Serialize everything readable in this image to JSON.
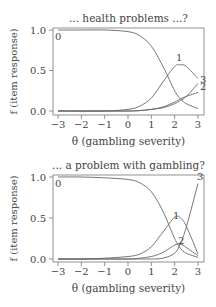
{
  "chart_data": [
    {
      "type": "line",
      "title": "... health problems ...?",
      "xlabel": "θ (gambling severity)",
      "ylabel": "f (item response)",
      "xlim": [
        -3,
        3
      ],
      "ylim": [
        0,
        1
      ],
      "xticks": [
        "-3",
        "-2",
        "-1",
        "0",
        "1",
        "2",
        "3"
      ],
      "yticks": [
        "0.0",
        "0.5",
        "1.0"
      ],
      "grid": false,
      "legend": "inline curve labels",
      "x": [
        -3,
        -2,
        -1,
        0,
        0.5,
        1,
        1.5,
        2,
        2.25,
        2.5,
        3
      ],
      "series": [
        {
          "name": "0",
          "values": [
            1.0,
            1.0,
            1.0,
            0.98,
            0.93,
            0.8,
            0.55,
            0.25,
            0.15,
            0.09,
            0.03
          ]
        },
        {
          "name": "1",
          "values": [
            0.0,
            0.0,
            0.0,
            0.02,
            0.06,
            0.16,
            0.36,
            0.55,
            0.57,
            0.55,
            0.4
          ]
        },
        {
          "name": "2",
          "values": [
            0.0,
            0.0,
            0.0,
            0.0,
            0.005,
            0.02,
            0.05,
            0.11,
            0.15,
            0.18,
            0.23
          ]
        },
        {
          "name": "3",
          "values": [
            0.0,
            0.0,
            0.0,
            0.0,
            0.005,
            0.02,
            0.04,
            0.09,
            0.13,
            0.18,
            0.34
          ]
        }
      ]
    },
    {
      "type": "line",
      "title": "... a problem with gambling?",
      "xlabel": "θ (gambling severity)",
      "ylabel": "f (item response)",
      "xlim": [
        -3,
        3
      ],
      "ylim": [
        0,
        1
      ],
      "xticks": [
        "-3",
        "-2",
        "-1",
        "0",
        "1",
        "2",
        "3"
      ],
      "yticks": [
        "0.0",
        "0.5",
        "1.0"
      ],
      "grid": false,
      "legend": "inline curve labels",
      "x": [
        -3,
        -2,
        -1,
        0,
        0.5,
        1,
        1.5,
        2,
        2.25,
        2.5,
        3
      ],
      "series": [
        {
          "name": "0",
          "values": [
            1.0,
            1.0,
            0.99,
            0.97,
            0.93,
            0.82,
            0.58,
            0.25,
            0.13,
            0.07,
            0.02
          ]
        },
        {
          "name": "1",
          "values": [
            0.0,
            0.0,
            0.01,
            0.03,
            0.06,
            0.15,
            0.33,
            0.51,
            0.5,
            0.4,
            0.06
          ]
        },
        {
          "name": "2",
          "values": [
            0.0,
            0.0,
            0.0,
            0.0,
            0.01,
            0.03,
            0.08,
            0.17,
            0.18,
            0.14,
            0.04
          ]
        },
        {
          "name": "3",
          "values": [
            0.0,
            0.0,
            0.0,
            0.0,
            0.0,
            0.0,
            0.01,
            0.07,
            0.19,
            0.39,
            0.92
          ]
        }
      ]
    }
  ]
}
